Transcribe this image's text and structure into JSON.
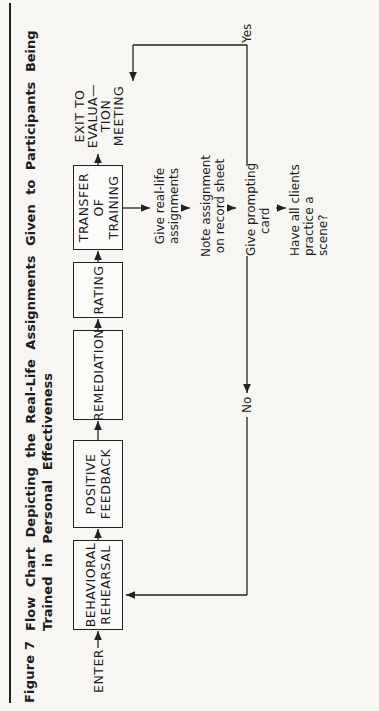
{
  "figure": {
    "label": "Figure 7",
    "title": "Flow Chart Depicting the Real-Life Assignments Given to Participants Being Trained in Personal Effectiveness"
  },
  "flow": {
    "enter": "ENTER",
    "boxes": [
      {
        "line1": "BEHAVIORAL",
        "line2": "REHEARSAL"
      },
      {
        "line1": "POSITIVE",
        "line2": "FEEDBACK"
      },
      {
        "line1": "REMEDIATION",
        "line2": ""
      },
      {
        "line1": "RATING",
        "line2": ""
      },
      {
        "line1": "TRANSFER",
        "line2": "OF",
        "line3": "TRAINING"
      }
    ],
    "exit": {
      "line1": "EXIT TO",
      "line2": "EVALUA—",
      "line3": "TION",
      "line4": "MEETING"
    },
    "steps": [
      {
        "line1": "Give real-life",
        "line2": "assignments"
      },
      {
        "line1": "Note assignment",
        "line2": "on record sheet"
      },
      {
        "line1": "Give prompting",
        "line2": "card"
      }
    ],
    "decision": {
      "line1": "Have all clients",
      "line2": "practice a scene?"
    },
    "yes_label": "Yes",
    "no_label": "No"
  }
}
